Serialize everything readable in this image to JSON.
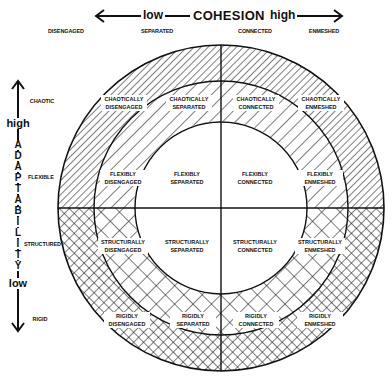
{
  "cohesion_axis": {
    "title": "COHESION",
    "low": "low",
    "high": "high",
    "levels": [
      "DISENGAGED",
      "SEPARATED",
      "CONNECTED",
      "ENMESHED"
    ]
  },
  "adaptability_axis": {
    "title_letters": [
      "A",
      "D",
      "A",
      "P",
      "T",
      "A",
      "B",
      "I",
      "L",
      "I",
      "T",
      "Y"
    ],
    "high": "high",
    "low": "low",
    "levels": [
      "CHAOTIC",
      "FLEXIBLE",
      "STRUCTURED",
      "RIGID"
    ]
  },
  "cells": {
    "chaotic": [
      {
        "line1": "CHAOTICALLY",
        "line2": "DISENGAGED"
      },
      {
        "line1": "CHAOTICALLY",
        "line2": "SEPARATED"
      },
      {
        "line1": "CHAOTICALLY",
        "line2": "CONNECTED"
      },
      {
        "line1": "CHAOTICALLY",
        "line2": "ENMESHED"
      }
    ],
    "flexible": [
      {
        "line1": "FLEXIBLY",
        "line2": "DISENGAGED"
      },
      {
        "line1": "FLEXIBLY",
        "line2": "SEPARATED"
      },
      {
        "line1": "FLEXIBLY",
        "line2": "CONNECTED"
      },
      {
        "line1": "FLEXIBLY",
        "line2": "ENMESHED"
      }
    ],
    "structured": [
      {
        "line1": "STRUCTURALLY",
        "line2": "DISENGAGED"
      },
      {
        "line1": "STRUCTURALLY",
        "line2": "SEPARATED"
      },
      {
        "line1": "STRUCTURALLY",
        "line2": "CONNECTED"
      },
      {
        "line1": "STRUCTURALLY",
        "line2": "ENMESHED"
      }
    ],
    "rigid": [
      {
        "line1": "RIGIDLY",
        "line2": "DISENGAGED"
      },
      {
        "line1": "RIGIDLY",
        "line2": "SEPARATED"
      },
      {
        "line1": "RIGIDLY",
        "line2": "CONNECTED"
      },
      {
        "line1": "RIGIDLY",
        "line2": "ENMESHED"
      }
    ]
  },
  "colors": {
    "ink": "#111111",
    "background": "#ffffff"
  }
}
